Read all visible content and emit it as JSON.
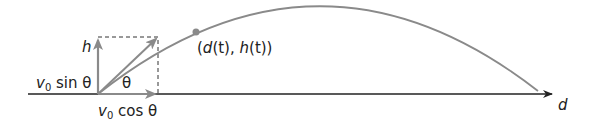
{
  "diagram": {
    "type": "projectile-motion",
    "labels": {
      "vertical_axis": "h",
      "horizontal_axis": "d",
      "point": "(d(t), h(t))",
      "vertical_component": "v0 sin θ",
      "horizontal_component": "v0 cos θ",
      "angle": "θ"
    },
    "parts": {
      "v_sub_base": "v",
      "v_sub_index": "0",
      "sin_text": " sin θ",
      "cos_text": " cos θ",
      "theta": "θ",
      "h": "h",
      "d": "d",
      "point_open": "(",
      "point_d": "d",
      "point_t1": "(t), ",
      "point_h": "h",
      "point_t2": "(t))"
    },
    "colors": {
      "axis": "#222222",
      "vector": "#8a8a8a",
      "trajectory": "#8a8a8a",
      "point": "#8a8a8a",
      "dashed_box": "#333333"
    }
  }
}
